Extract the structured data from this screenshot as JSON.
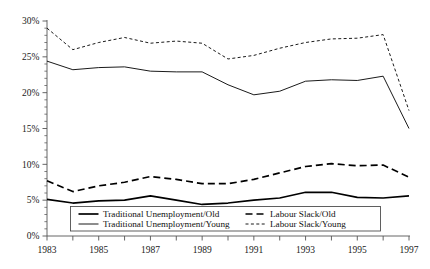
{
  "chart_data": {
    "type": "line",
    "title": "",
    "xlabel": "",
    "ylabel": "",
    "x": [
      1983,
      1984,
      1985,
      1986,
      1987,
      1988,
      1989,
      1990,
      1991,
      1992,
      1993,
      1994,
      1995,
      1996,
      1997
    ],
    "xlim": [
      1983,
      1997
    ],
    "ylim": [
      0,
      30
    ],
    "ytick_values": [
      0,
      5,
      10,
      15,
      20,
      25,
      30
    ],
    "ytick_labels": [
      "0%",
      "5%",
      "10%",
      "15%",
      "20%",
      "25%",
      "30%"
    ],
    "y_minor_tick_step": 1,
    "xtick_values": [
      1983,
      1984,
      1985,
      1986,
      1987,
      1988,
      1989,
      1990,
      1991,
      1992,
      1993,
      1994,
      1995,
      1996,
      1997
    ],
    "xtick_labels": [
      "1983",
      "",
      "1985",
      "",
      "1987",
      "",
      "1989",
      "",
      "1991",
      "",
      "1993",
      "",
      "1995",
      "",
      "1997"
    ],
    "grid": false,
    "legend_position": "lower-center",
    "series": [
      {
        "name": "Traditional Unemployment/Old",
        "style": "solid",
        "width": 1.7,
        "color": "#000000",
        "values": [
          5.1,
          4.6,
          4.9,
          5.0,
          5.6,
          5.0,
          4.4,
          4.6,
          5.0,
          5.3,
          6.1,
          6.1,
          5.4,
          5.3,
          5.6
        ]
      },
      {
        "name": "Traditional Unemployment/Young",
        "style": "solid",
        "width": 0.9,
        "color": "#000000",
        "values": [
          24.4,
          23.2,
          23.5,
          23.6,
          23.0,
          22.9,
          22.9,
          21.1,
          19.7,
          20.2,
          21.6,
          21.8,
          21.7,
          22.3,
          15.0
        ]
      },
      {
        "name": "Labour Slack/Old",
        "style": "dashed",
        "width": 1.7,
        "color": "#000000",
        "dash": "7,4",
        "values": [
          7.7,
          6.2,
          7.0,
          7.5,
          8.3,
          7.9,
          7.3,
          7.3,
          7.9,
          8.8,
          9.7,
          10.1,
          9.8,
          9.9,
          8.2
        ]
      },
      {
        "name": "Labour Slack/Young",
        "style": "dotted-dashed",
        "width": 0.9,
        "color": "#000000",
        "dash": "3,2.4",
        "values": [
          29.0,
          26.0,
          27.0,
          27.7,
          26.9,
          27.2,
          26.9,
          24.7,
          25.2,
          26.2,
          27.0,
          27.5,
          27.6,
          28.1,
          17.5
        ]
      }
    ],
    "legend": [
      {
        "label": "Traditional Unemployment/Old",
        "style": "solid",
        "width": 1.7,
        "dash": ""
      },
      {
        "label": "Labour Slack/Old",
        "style": "dashed",
        "width": 1.7,
        "dash": "7,4"
      },
      {
        "label": "Traditional Unemployment/Young",
        "style": "solid",
        "width": 0.9,
        "dash": ""
      },
      {
        "label": "Labour Slack/Young",
        "style": "dotted-dashed",
        "width": 0.9,
        "dash": "3,2.4"
      }
    ]
  },
  "axes": {
    "y_labels": [
      "30%",
      "25%",
      "20%",
      "15%",
      "10%",
      "5%",
      "0%"
    ],
    "x_labels": [
      "1983",
      "1985",
      "1987",
      "1989",
      "1991",
      "1993",
      "1995",
      "1997"
    ]
  },
  "colors": {
    "line": "#000000",
    "axis": "#555555",
    "legend_border": "#444444",
    "background": "#ffffff"
  }
}
